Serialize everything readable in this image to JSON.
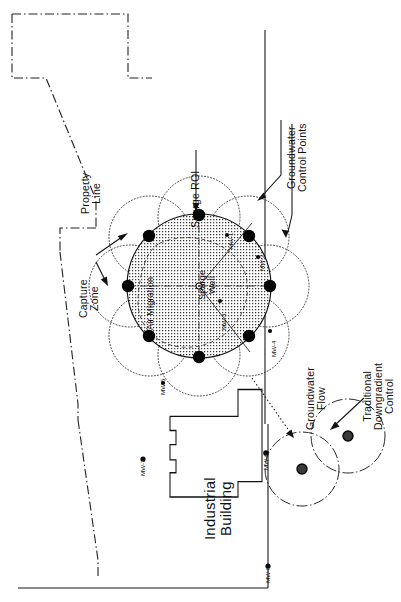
{
  "diagram": {
    "orientation": "rotated-90",
    "background_color": "#ffffff",
    "ink_color": "#111111"
  },
  "labels": {
    "property_line": "Property\nLine",
    "capture_zone": "Capture\nZone",
    "sparge_roi": "Sparge ROI",
    "groundwater_control_points": "Groundwater\nControl Points",
    "air_migration": "Air Migration",
    "sparge_well": "Sparge\nWell",
    "industrial_building": "Industrial\nBuilding",
    "groundwater_flow": "Groundwater\nFlow",
    "traditional_downgradient_control": "Traditional\nDowngradient\nControl"
  },
  "monitoring_wells": [
    {
      "id": "MW-1",
      "label": "MW-1"
    },
    {
      "id": "MW-2",
      "label": "MW-2"
    },
    {
      "id": "MW-3",
      "label": "MW-3"
    },
    {
      "id": "MW-4",
      "label": "MW-4"
    },
    {
      "id": "MW-5",
      "label": "MW-5"
    },
    {
      "id": "MW-6",
      "label": "MW-6"
    },
    {
      "id": "MW-7",
      "label": "MW-7"
    },
    {
      "id": "MW-8",
      "label": "MW-8"
    }
  ],
  "features": {
    "sparge_roi_circle_name": "sparge-roi-stippled-circle",
    "control_point_count": 8,
    "capture_zone_circle_count": 8,
    "extraction_well_count": 2,
    "sparge_well_marker": "sparge-well-center-marker"
  }
}
